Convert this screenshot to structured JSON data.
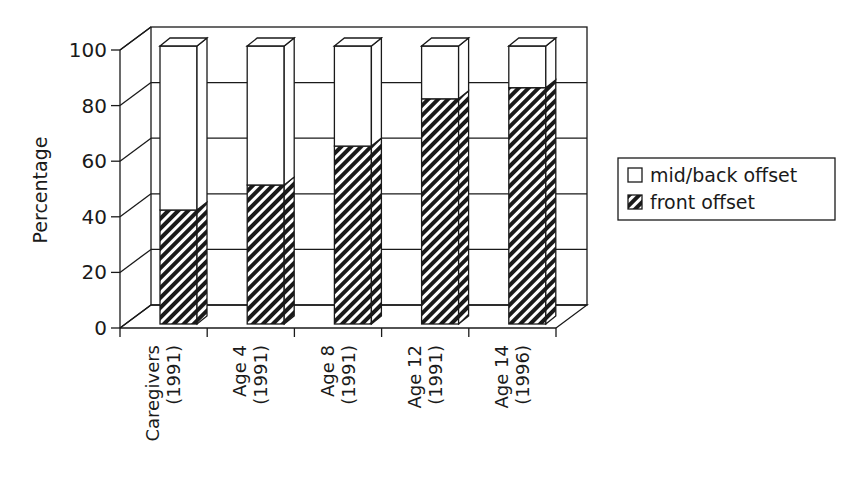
{
  "chart_data": {
    "type": "bar",
    "stacked": true,
    "three_d": true,
    "title": "",
    "xlabel": "",
    "ylabel": "Percentage",
    "ylim": [
      0,
      100
    ],
    "yticks": [
      0,
      20,
      40,
      60,
      80,
      100
    ],
    "grid": true,
    "legend_position": "right",
    "categories": [
      [
        "Caregivers",
        "(1991)"
      ],
      [
        "Age 4",
        "(1991)"
      ],
      [
        "Age 8",
        "(1991)"
      ],
      [
        "Age 12",
        "(1991)"
      ],
      [
        "Age 14",
        "(1996)"
      ]
    ],
    "series": [
      {
        "name": "front offset",
        "pattern": "diagonal-hatch",
        "values": [
          41,
          50,
          64,
          81,
          85
        ]
      },
      {
        "name": "mid/back offset",
        "pattern": "white",
        "values": [
          59,
          50,
          36,
          19,
          15
        ]
      }
    ],
    "legend": [
      {
        "label": "mid/back offset",
        "swatch": "white"
      },
      {
        "label": "front offset",
        "swatch": "hatch"
      }
    ]
  },
  "colors": {
    "ink": "#1a1a1a",
    "background": "#ffffff"
  }
}
